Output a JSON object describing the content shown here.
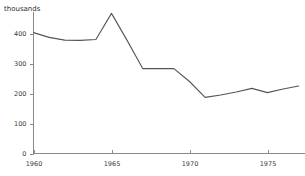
{
  "chart_data": {
    "type": "line",
    "title": "thousands",
    "subtitle": "",
    "xlabel": "",
    "ylabel": "thousands",
    "grid": false,
    "legend": false,
    "xlim": [
      1960,
      1977
    ],
    "ylim": [
      0,
      500
    ],
    "x": [
      1960,
      1961,
      1962,
      1963,
      1964,
      1965,
      1966,
      1967,
      1968,
      1969,
      1970,
      1971,
      1972,
      1973,
      1974,
      1975,
      1976,
      1977
    ],
    "values": [
      403,
      387,
      378,
      377,
      380,
      467,
      377,
      283,
      283,
      283,
      240,
      187,
      195,
      205,
      217,
      203,
      215,
      225
    ],
    "series": [
      {
        "name": "thousands",
        "values": [
          403,
          387,
          378,
          377,
          380,
          467,
          377,
          283,
          283,
          283,
          240,
          187,
          195,
          205,
          217,
          203,
          215,
          225
        ]
      }
    ],
    "y_ticks": [
      0,
      100,
      200,
      300,
      400
    ],
    "y_tick_labels": [
      "0",
      "100",
      "200",
      "300",
      "400"
    ],
    "x_ticks": [
      1960,
      1965,
      1970,
      1975
    ],
    "x_tick_labels": [
      "1960",
      "1965",
      "1970",
      "1975"
    ],
    "colors": {
      "line": "#555555",
      "axis": "#8a8a8a",
      "text": "#3a3a3a",
      "background": "#ffffff"
    }
  }
}
